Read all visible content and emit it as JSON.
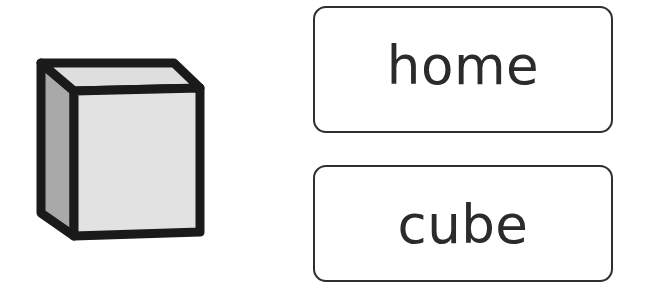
{
  "page": {
    "background_color": "#ffffff",
    "width": 653,
    "height": 291,
    "type": "vocabulary-picture-word-match"
  },
  "illustration": {
    "name": "cube-illustration",
    "subject": "cube",
    "description": "Black-outlined three-dimensional cube drawn in isometric-style perspective",
    "colors": {
      "outline": "#1a1a1a",
      "front_face": "#e2e2e2",
      "left_face": "#a9a9a9",
      "top_face": "#dedede"
    }
  },
  "cards": [
    {
      "id": "home",
      "name": "word-card-home",
      "text": "home",
      "border_color": "#2f2f2f",
      "background_color": "#ffffff",
      "text_color": "#2b2b2b"
    },
    {
      "id": "cube",
      "name": "word-card-cube",
      "text": "cube",
      "border_color": "#2f2f2f",
      "background_color": "#ffffff",
      "text_color": "#2b2b2b"
    }
  ]
}
